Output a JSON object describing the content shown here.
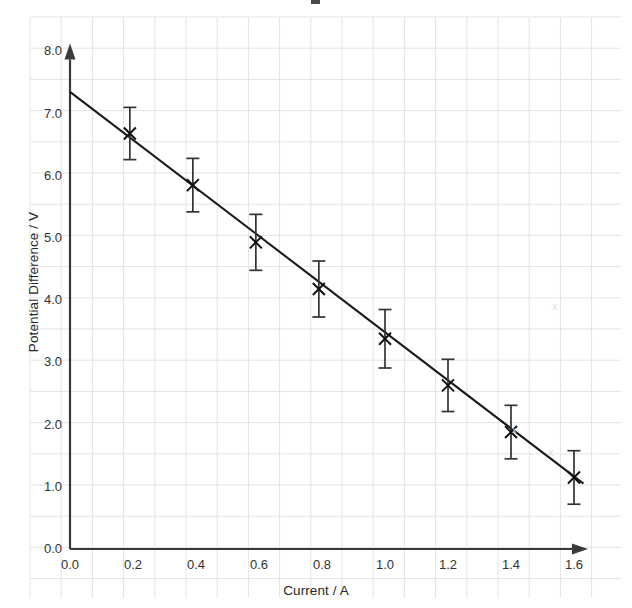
{
  "chart_data": {
    "type": "scatter",
    "title": "",
    "xlabel": "Current / A",
    "ylabel": "Potential Difference / V",
    "xlim": [
      0.0,
      1.75
    ],
    "ylim": [
      0.0,
      8.0
    ],
    "grid": true,
    "legend": null,
    "xticks": [
      "0.0",
      "0.2",
      "0.4",
      "0.6",
      "0.8",
      "1.0",
      "1.2",
      "1.4",
      "1.6"
    ],
    "xtick_values": [
      0.0,
      0.2,
      0.4,
      0.6,
      0.8,
      1.0,
      1.2,
      1.4,
      1.6
    ],
    "yticks": [
      "0.0",
      "1.0",
      "2.0",
      "3.0",
      "4.0",
      "5.0",
      "6.0",
      "7.0",
      "8.0"
    ],
    "ytick_values": [
      0.0,
      1.0,
      2.0,
      3.0,
      4.0,
      5.0,
      6.0,
      7.0,
      8.0
    ],
    "marker": "x-cross",
    "x": [
      0.19,
      0.39,
      0.59,
      0.79,
      1.0,
      1.2,
      1.4,
      1.6
    ],
    "y": [
      6.68,
      5.85,
      4.93,
      4.18,
      3.38,
      2.63,
      1.88,
      1.15
    ],
    "yerr": [
      0.42,
      0.43,
      0.45,
      0.45,
      0.47,
      0.42,
      0.43,
      0.43
    ],
    "fit_line": {
      "x0": 0.0,
      "y0": 7.35,
      "x1": 1.63,
      "y1": 1.05,
      "style": "solid",
      "color": "#1a1a1a"
    },
    "series": [
      {
        "name": "measurements",
        "points": [
          {
            "x": 0.19,
            "y": 6.68,
            "err": 0.42
          },
          {
            "x": 0.39,
            "y": 5.85,
            "err": 0.43
          },
          {
            "x": 0.59,
            "y": 4.93,
            "err": 0.45
          },
          {
            "x": 0.79,
            "y": 4.18,
            "err": 0.45
          },
          {
            "x": 1.0,
            "y": 3.38,
            "err": 0.47
          },
          {
            "x": 1.2,
            "y": 2.63,
            "err": 0.42
          },
          {
            "x": 1.4,
            "y": 1.88,
            "err": 0.43
          },
          {
            "x": 1.6,
            "y": 1.15,
            "err": 0.43
          }
        ]
      }
    ],
    "colors": {
      "data": "#1a1a1a",
      "line": "#1a1a1a",
      "axis": "#3a3a3a",
      "grid": "#e3e3e6",
      "background": "#ffffff"
    }
  },
  "axes": {
    "x_axis_name": "Current / A",
    "y_axis_name": "Potential Difference / V",
    "origin_label_x": "0.0",
    "origin_label_y": "0.0"
  },
  "artifacts": {
    "smudge_1": "x",
    "smudge_2": "x",
    "smudge_3": "x"
  }
}
